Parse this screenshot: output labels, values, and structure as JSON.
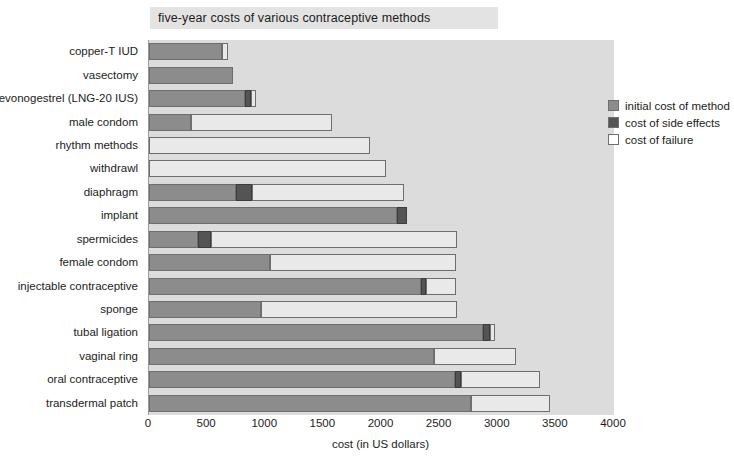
{
  "chart_data": {
    "type": "bar",
    "orientation": "horizontal",
    "stacked": true,
    "title": "five-year costs of various contraceptive methods",
    "xlabel": "cost (in US dollars)",
    "ylabel": "",
    "xlim": [
      0,
      4000
    ],
    "xticks": [
      0,
      500,
      1000,
      1500,
      2000,
      2500,
      3000,
      3500,
      4000
    ],
    "grid": false,
    "legend_position": "top-right",
    "categories": [
      "copper-T IUD",
      "vasectomy",
      "levonogestrel (LNG-20 IUS)",
      "male condom",
      "rhythm methods",
      "withdrawl",
      "diaphragm",
      "implant",
      "spermicides",
      "female condom",
      "injectable contraceptive",
      "sponge",
      "tubal ligation",
      "vaginal ring",
      "oral contraceptive",
      "transdermal patch"
    ],
    "series": [
      {
        "name": "initial cost of method",
        "color": "#8c8c8c",
        "values": [
          630,
          720,
          830,
          360,
          0,
          0,
          750,
          2130,
          420,
          1040,
          2340,
          960,
          2870,
          2450,
          2630,
          2770
        ]
      },
      {
        "name": "cost of side effects",
        "color": "#545454",
        "values": [
          0,
          0,
          45,
          0,
          0,
          0,
          140,
          90,
          115,
          0,
          40,
          0,
          60,
          0,
          55,
          0
        ]
      },
      {
        "name": "cost of failure",
        "color": "#e9e9e9",
        "values": [
          50,
          0,
          45,
          1215,
          1900,
          2035,
          1300,
          0,
          2115,
          1600,
          260,
          1690,
          45,
          705,
          680,
          680
        ]
      }
    ],
    "totals": [
      680,
      720,
      920,
      1575,
      1900,
      2035,
      2190,
      2220,
      2650,
      2640,
      2640,
      2650,
      2975,
      3155,
      3365,
      3450
    ]
  },
  "legend": {
    "items": [
      {
        "label": "initial cost of method",
        "swatch": "light-gray-swatch-icon"
      },
      {
        "label": "cost of side effects",
        "swatch": "dark-gray-swatch-icon"
      },
      {
        "label": "cost of failure",
        "swatch": "white-swatch-icon"
      }
    ]
  },
  "colors": {
    "initial": "#8c8c8c",
    "side_effects": "#545454",
    "failure": "#e9e9e9",
    "plot_background": "#dcdcdc",
    "title_background": "#e3e3e3",
    "text": "#1c1c1c"
  }
}
